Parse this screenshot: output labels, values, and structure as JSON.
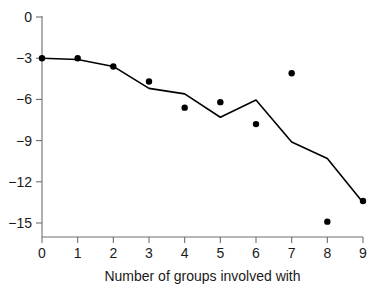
{
  "chart_data": {
    "type": "scatter",
    "title": "",
    "subtitle": "",
    "xlabel": "Number of groups involved with",
    "ylabel": "",
    "xlim": [
      0,
      9
    ],
    "ylim": [
      -15.8,
      0.6
    ],
    "grid": false,
    "legend": null,
    "x_ticks": [
      "0",
      "1",
      "2",
      "3",
      "4",
      "5",
      "6",
      "7",
      "8",
      "9"
    ],
    "x_tick_values": [
      0,
      1,
      2,
      3,
      4,
      5,
      6,
      7,
      8,
      9
    ],
    "y_ticks": [
      "0",
      "−3",
      "−6",
      "−9",
      "−12",
      "−15"
    ],
    "y_tick_values": [
      0,
      -3,
      -6,
      -9,
      -12,
      -15
    ],
    "colors": {
      "point": "#000000",
      "line": "#000000",
      "axis": "#6f6f6f",
      "text": "#1a1a1a",
      "background": "#ffffff"
    },
    "series": [
      {
        "name": "observed-points",
        "type": "scatter",
        "marker": "filled-circle",
        "x": [
          0,
          1,
          2,
          3,
          4,
          5,
          6,
          7,
          8,
          9
        ],
        "values": [
          -3.0,
          -3.0,
          -3.6,
          -4.7,
          -6.6,
          -6.2,
          -7.8,
          -4.1,
          -14.9,
          -13.4
        ]
      },
      {
        "name": "fitted-line",
        "type": "line",
        "x": [
          0,
          1,
          2,
          3,
          4,
          5,
          6,
          7,
          8,
          9
        ],
        "values": [
          -3.0,
          -3.1,
          -3.6,
          -5.2,
          -5.6,
          -7.3,
          -6.05,
          -9.1,
          -10.3,
          -13.5
        ]
      }
    ]
  }
}
